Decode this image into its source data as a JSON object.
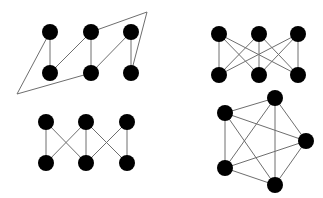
{
  "diagram": {
    "style": {
      "node_color": "#000000",
      "edge_color": "#6e6e6e",
      "node_radius": 8,
      "background": "#ffffff"
    },
    "graphs": [
      {
        "id": "graph-1",
        "position": "top-left",
        "nodes": [
          {
            "id": "a1",
            "x": 50,
            "y": 32
          },
          {
            "id": "a2",
            "x": 91,
            "y": 32
          },
          {
            "id": "a3",
            "x": 131,
            "y": 32
          },
          {
            "id": "b1",
            "x": 50,
            "y": 73
          },
          {
            "id": "b2",
            "x": 91,
            "y": 73
          },
          {
            "id": "b3",
            "x": 131,
            "y": 73
          }
        ],
        "bend_points": [
          {
            "id": "p1",
            "x": 147,
            "y": 12
          },
          {
            "id": "p2",
            "x": 17,
            "y": 94
          }
        ],
        "edges": [
          [
            "a1",
            "b1"
          ],
          [
            "a2",
            "b2"
          ],
          [
            "a3",
            "b3"
          ],
          [
            "b1",
            "a2"
          ],
          [
            "b2",
            "a3"
          ],
          [
            "a2",
            "p1",
            "b3"
          ],
          [
            "a1",
            "p2",
            "b2"
          ]
        ]
      },
      {
        "id": "graph-2",
        "position": "top-right",
        "label": "K3,3",
        "nodes": [
          {
            "id": "a1",
            "x": 219,
            "y": 34
          },
          {
            "id": "a2",
            "x": 259,
            "y": 34
          },
          {
            "id": "a3",
            "x": 298,
            "y": 34
          },
          {
            "id": "b1",
            "x": 219,
            "y": 75
          },
          {
            "id": "b2",
            "x": 259,
            "y": 75
          },
          {
            "id": "b3",
            "x": 298,
            "y": 75
          }
        ],
        "edges": [
          [
            "a1",
            "b1"
          ],
          [
            "a1",
            "b2"
          ],
          [
            "a1",
            "b3"
          ],
          [
            "a2",
            "b1"
          ],
          [
            "a2",
            "b2"
          ],
          [
            "a2",
            "b3"
          ],
          [
            "a3",
            "b1"
          ],
          [
            "a3",
            "b2"
          ],
          [
            "a3",
            "b3"
          ]
        ]
      },
      {
        "id": "graph-3",
        "position": "bottom-left",
        "nodes": [
          {
            "id": "a1",
            "x": 46,
            "y": 122
          },
          {
            "id": "a2",
            "x": 86,
            "y": 122
          },
          {
            "id": "a3",
            "x": 127,
            "y": 122
          },
          {
            "id": "b1",
            "x": 46,
            "y": 163
          },
          {
            "id": "b2",
            "x": 86,
            "y": 163
          },
          {
            "id": "b3",
            "x": 127,
            "y": 163
          }
        ],
        "edges": [
          [
            "a1",
            "b1"
          ],
          [
            "a1",
            "b2"
          ],
          [
            "a2",
            "b1"
          ],
          [
            "a2",
            "b2"
          ],
          [
            "a2",
            "b3"
          ],
          [
            "a3",
            "b2"
          ],
          [
            "a3",
            "b3"
          ]
        ]
      },
      {
        "id": "graph-4",
        "position": "bottom-right",
        "label": "K5",
        "nodes": [
          {
            "id": "v1",
            "x": 275,
            "y": 98
          },
          {
            "id": "v2",
            "x": 225,
            "y": 113
          },
          {
            "id": "v3",
            "x": 306,
            "y": 141
          },
          {
            "id": "v4",
            "x": 225,
            "y": 168
          },
          {
            "id": "v5",
            "x": 275,
            "y": 185
          }
        ],
        "edges": [
          [
            "v1",
            "v2"
          ],
          [
            "v1",
            "v3"
          ],
          [
            "v1",
            "v4"
          ],
          [
            "v1",
            "v5"
          ],
          [
            "v2",
            "v3"
          ],
          [
            "v2",
            "v4"
          ],
          [
            "v2",
            "v5"
          ],
          [
            "v3",
            "v4"
          ],
          [
            "v3",
            "v5"
          ],
          [
            "v4",
            "v5"
          ]
        ]
      }
    ]
  }
}
